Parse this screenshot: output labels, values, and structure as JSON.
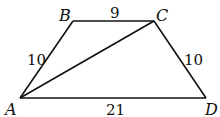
{
  "diagram": {
    "type": "trapezoid",
    "vertices": [
      {
        "id": "A",
        "label": "A",
        "x": 20,
        "y": 98
      },
      {
        "id": "B",
        "label": "B",
        "x": 73,
        "y": 21
      },
      {
        "id": "C",
        "label": "C",
        "x": 154,
        "y": 21
      },
      {
        "id": "D",
        "label": "D",
        "x": 206,
        "y": 98
      }
    ],
    "segments": [
      {
        "from": "A",
        "to": "B",
        "length_label": "10"
      },
      {
        "from": "B",
        "to": "C",
        "length_label": "9"
      },
      {
        "from": "C",
        "to": "D",
        "length_label": "10"
      },
      {
        "from": "A",
        "to": "D",
        "length_label": "21"
      },
      {
        "from": "A",
        "to": "C",
        "length_label": ""
      }
    ],
    "stroke_color": "#111111"
  },
  "labels": {
    "A": "A",
    "B": "B",
    "C": "C",
    "D": "D",
    "AB": "10",
    "BC": "9",
    "CD": "10",
    "AD": "21"
  }
}
